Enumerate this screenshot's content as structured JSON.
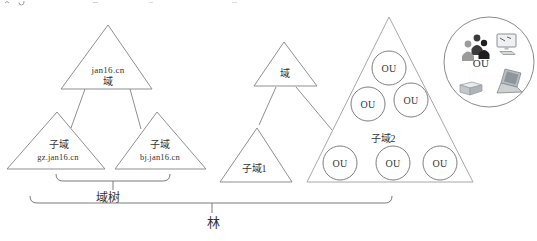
{
  "canvas": {
    "width": 537,
    "height": 241,
    "background": "#ffffff"
  },
  "colors": {
    "triangle_stroke": "#8f8f8f",
    "big_triangle_stroke": "#a8a8a8",
    "circle_stroke": "#7f7f7f",
    "bracket_stroke": "#7d7d7d",
    "text": "#333333"
  },
  "domain_tree": {
    "root": {
      "name": "jan16.cn",
      "type_label": "域"
    },
    "left_child": {
      "type_label": "子域",
      "name": "gz.jan16.cn"
    },
    "right_child": {
      "type_label": "子域",
      "name": "bj.jan16.cn"
    },
    "bracket_label": "域树"
  },
  "single_tree": {
    "root_label": "域",
    "child_label": "子域1"
  },
  "subdomain2": {
    "label": "子域2",
    "ou": [
      "OU",
      "OU",
      "OU",
      "OU",
      "OU",
      "OU"
    ]
  },
  "ou_detail": {
    "label": "OU"
  },
  "forest": {
    "label": "林"
  }
}
